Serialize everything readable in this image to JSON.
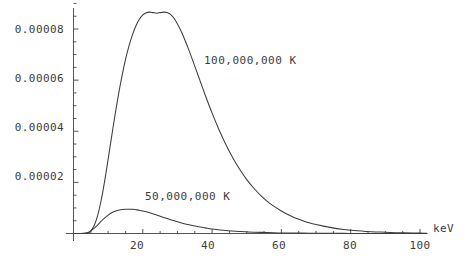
{
  "chart_data": {
    "type": "line",
    "title": "",
    "subtitle": "",
    "xlabel": "keV",
    "ylabel": "",
    "xlim": [
      0,
      103
    ],
    "ylim": [
      0,
      9.25e-05
    ],
    "grid": false,
    "legend_position": "inline-annotations",
    "x_ticks": [
      "20",
      "40",
      "60",
      "80",
      "100"
    ],
    "x_tick_values": [
      20,
      40,
      60,
      80,
      100
    ],
    "x_minor_tick_values": [
      5,
      10,
      15,
      25,
      30,
      35,
      45,
      50,
      55,
      65,
      70,
      75,
      85,
      90,
      95
    ],
    "y_ticks": [
      "0.00002",
      "0.00004",
      "0.00006",
      "0.00008"
    ],
    "y_tick_values": [
      2e-05,
      4e-05,
      6e-05,
      8e-05
    ],
    "y_minor_tick_values": [
      5e-06,
      1e-05,
      1.5e-05,
      2.5e-05,
      3e-05,
      3.5e-05,
      4.5e-05,
      5e-05,
      5.5e-05,
      6.5e-05,
      7e-05,
      7.5e-05,
      8.5e-05,
      9e-05
    ],
    "axis_color": "#555555",
    "curve_color": "#3c3c3c",
    "series": [
      {
        "name": "100,000,000 K",
        "label": "100,000,000 K",
        "peak_x": 27,
        "peak_y": 8.65e-05,
        "x": [
          0,
          2,
          4,
          5,
          6,
          7,
          8,
          9,
          10,
          11,
          12,
          13,
          14,
          15,
          16,
          17,
          18,
          19,
          20,
          21,
          22,
          23,
          24,
          25,
          26,
          27,
          28,
          29,
          30,
          31,
          32,
          33,
          34,
          35,
          36,
          38,
          40,
          42,
          44,
          46,
          48,
          50,
          52,
          54,
          56,
          58,
          60,
          62,
          64,
          66,
          68,
          70,
          74,
          78,
          82,
          86,
          90,
          94,
          98,
          100,
          102
        ],
        "y": [
          0,
          0.0,
          2e-07,
          1e-06,
          3.2e-06,
          7.2e-06,
          1.31e-05,
          2.06e-05,
          2.91e-05,
          3.79e-05,
          4.65e-05,
          5.45e-05,
          6.17e-05,
          6.8e-05,
          7.33e-05,
          7.77e-05,
          8.12e-05,
          8.38e-05,
          8.55e-05,
          8.64e-05,
          8.66e-05,
          8.64e-05,
          8.62e-05,
          8.64e-05,
          8.66e-05,
          8.65e-05,
          8.57e-05,
          8.42e-05,
          8.2e-05,
          7.93e-05,
          7.62e-05,
          7.28e-05,
          6.92e-05,
          6.55e-05,
          6.17e-05,
          5.42e-05,
          4.71e-05,
          4.06e-05,
          3.47e-05,
          2.95e-05,
          2.5e-05,
          2.11e-05,
          1.78e-05,
          1.49e-05,
          1.25e-05,
          1.05e-05,
          8.8e-06,
          7.3e-06,
          6.1e-06,
          5.1e-06,
          4.2e-06,
          3.5e-06,
          2.4e-06,
          1.6e-06,
          1.1e-06,
          7e-07,
          5e-07,
          3e-07,
          2e-07,
          2e-07,
          1e-07
        ]
      },
      {
        "name": "50,000,000 K",
        "label": "50,000,000 K",
        "peak_x": 17,
        "peak_y": 9.5e-06,
        "x": [
          0,
          2,
          4,
          5,
          6,
          7,
          8,
          9,
          10,
          11,
          12,
          13,
          14,
          15,
          16,
          17,
          18,
          19,
          20,
          21,
          22,
          24,
          26,
          28,
          30,
          32,
          34,
          36,
          38,
          40,
          44,
          48,
          52,
          56,
          60,
          64,
          68,
          72,
          76,
          80,
          85,
          90,
          95,
          100,
          102
        ],
        "y": [
          0,
          0.0,
          3e-07,
          1e-06,
          2.1e-06,
          3.4e-06,
          4.8e-06,
          6.1e-06,
          7.2e-06,
          8.1e-06,
          8.7e-06,
          9.1e-06,
          9.4e-06,
          9.5e-06,
          9.5e-06,
          9.5e-06,
          9.3e-06,
          9.1e-06,
          8.8e-06,
          8.5e-06,
          8.1e-06,
          7.2e-06,
          6.3e-06,
          5.4e-06,
          4.6e-06,
          3.8e-06,
          3.2e-06,
          2.6e-06,
          2.2e-06,
          1.8e-06,
          1.2e-06,
          8e-07,
          5e-07,
          4e-07,
          2e-07,
          2e-07,
          1e-07,
          1e-07,
          1e-07,
          0.0,
          0.0,
          0.0,
          0.0,
          0.0,
          0.0
        ]
      }
    ],
    "annotations": [
      {
        "text": "100,000,000 K",
        "x_px": 204,
        "y_px": 60
      },
      {
        "text": "50,000,000 K",
        "x_px": 145,
        "y_px": 196
      }
    ]
  },
  "axis_titles": {
    "x": "keV"
  }
}
